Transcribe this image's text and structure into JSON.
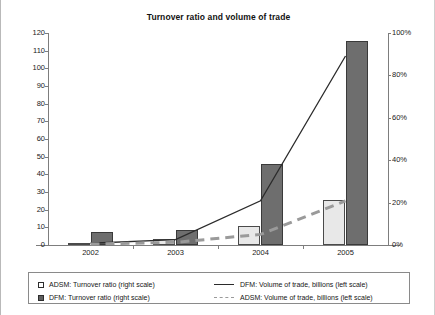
{
  "chart": {
    "title": "Turnover ratio and volume of trade"
  },
  "chart_data": {
    "type": "bar",
    "title": "Turnover ratio and volume of trade",
    "xlabel": "",
    "ylabel": "",
    "categories": [
      "2002",
      "2003",
      "2004",
      "2005"
    ],
    "left_axis": {
      "label": "",
      "ylim": [
        0,
        120
      ],
      "ticks": [
        0,
        10,
        20,
        30,
        40,
        50,
        60,
        70,
        80,
        90,
        100,
        110,
        120
      ],
      "tick_labels": [
        "0",
        "10",
        "20",
        "30",
        "40",
        "50",
        "60",
        "70",
        "80",
        "90",
        "100",
        "110",
        "120"
      ]
    },
    "right_axis": {
      "label": "",
      "ylim": [
        0,
        100
      ],
      "ticks": [
        0,
        20,
        40,
        60,
        80,
        100
      ],
      "tick_labels": [
        "0%",
        "20%",
        "40%",
        "60%",
        "80%",
        "100%"
      ]
    },
    "grid": false,
    "legend_position": "bottom",
    "series": [
      {
        "name": "ADSM: Turnover ratio (right scale)",
        "type": "bar",
        "axis": "right",
        "color": "#e8e8e8",
        "values": [
          1,
          3,
          9,
          21
        ]
      },
      {
        "name": "DFM: Turnover ratio (right scale)",
        "type": "bar",
        "axis": "right",
        "color": "#6e6e6e",
        "values": [
          6,
          7,
          38,
          96
        ]
      },
      {
        "name": "DFM: Volume of trade, billions (left scale)",
        "type": "line",
        "axis": "left",
        "color": "#2b2b2b",
        "style": "solid",
        "values": [
          1,
          3,
          25,
          107
        ]
      },
      {
        "name": "ADSM: Volume of trade, billions  (left scale)",
        "type": "line",
        "axis": "left",
        "color": "#9a9a9a",
        "style": "dashed",
        "values": [
          0.5,
          1.5,
          6,
          25
        ]
      }
    ]
  },
  "legend": {
    "entries": [
      {
        "marker": "square-open",
        "label": "ADSM: Turnover ratio (right scale)"
      },
      {
        "marker": "square-filled",
        "label": "DFM: Turnover ratio (right scale)"
      },
      {
        "marker": "line-solid",
        "label": "DFM: Volume of trade, billions (left scale)"
      },
      {
        "marker": "line-dashed",
        "label": "ADSM: Volume of trade, billions  (left scale)"
      }
    ]
  }
}
